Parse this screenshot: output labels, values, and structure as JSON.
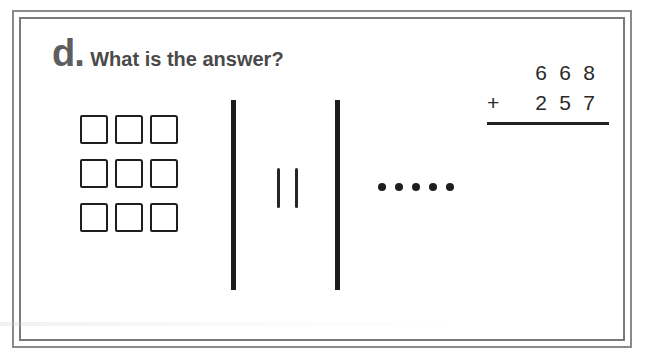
{
  "problem": {
    "letter": "d.",
    "question": "What is the answer?"
  },
  "blocks": {
    "hundreds": {
      "count": 9,
      "rows": 3,
      "cols": 3,
      "value_each": 100
    },
    "tens": {
      "count": 2,
      "value_each": 10
    },
    "ones": {
      "count": 5,
      "value_each": 1
    }
  },
  "addition": {
    "top": [
      "6",
      "6",
      "8"
    ],
    "operator": "+",
    "bottom": [
      "2",
      "5",
      "7"
    ]
  },
  "colors": {
    "ink": "#1e1e1e",
    "frame": "#8a8a8a",
    "title": "#4a4a4a"
  }
}
